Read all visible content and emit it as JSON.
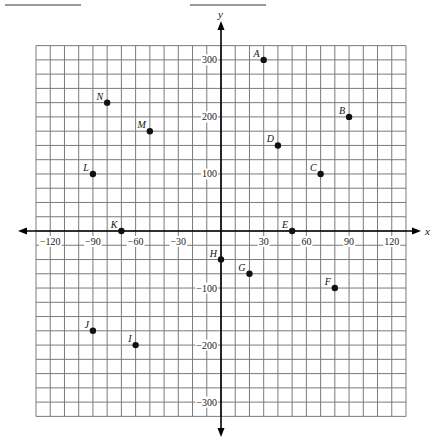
{
  "header": {
    "blanks": [
      {
        "x1": 5,
        "x2": 81
      },
      {
        "x1": 190,
        "x2": 266
      }
    ]
  },
  "chart_data": {
    "type": "scatter",
    "title": "",
    "xlabel": "x",
    "ylabel": "y",
    "xlim": [
      -130,
      130
    ],
    "ylim": [
      -325,
      325
    ],
    "grid": true,
    "x_grid_step": 10,
    "y_grid_step": 25,
    "x_ticks": [
      -120,
      -90,
      -60,
      -30,
      30,
      60,
      90,
      120
    ],
    "y_ticks": [
      300,
      200,
      100,
      -100,
      -200,
      -300
    ],
    "points": [
      {
        "label": "A",
        "x": 30,
        "y": 300
      },
      {
        "label": "B",
        "x": 90,
        "y": 200
      },
      {
        "label": "C",
        "x": 70,
        "y": 100
      },
      {
        "label": "D",
        "x": 40,
        "y": 150
      },
      {
        "label": "E",
        "x": 50,
        "y": 0
      },
      {
        "label": "F",
        "x": 80,
        "y": -100
      },
      {
        "label": "G",
        "x": 20,
        "y": -75
      },
      {
        "label": "H",
        "x": 0,
        "y": -50
      },
      {
        "label": "I",
        "x": -60,
        "y": -200
      },
      {
        "label": "J",
        "x": -90,
        "y": -175
      },
      {
        "label": "K",
        "x": -70,
        "y": 0
      },
      {
        "label": "L",
        "x": -90,
        "y": 100
      },
      {
        "label": "M",
        "x": -50,
        "y": 175
      },
      {
        "label": "N",
        "x": -80,
        "y": 225
      }
    ],
    "colors": {
      "grid": "#7a7a7a",
      "axis": "#000000",
      "point": "#111111"
    }
  }
}
